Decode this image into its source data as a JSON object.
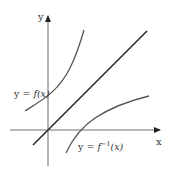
{
  "diagram": {
    "axes": {
      "x_label": "x",
      "y_label": "y",
      "axis_color": "#9a9a9a"
    },
    "curves": {
      "f": {
        "label": "y = f(x)",
        "label_prefix": "y = ",
        "label_body": "f(x)",
        "color": "#555555"
      },
      "f_inverse": {
        "label": "y = f⁻¹(x)",
        "label_prefix": "y = ",
        "label_f": "f",
        "label_sup": "−1",
        "label_arg": "(x)",
        "color": "#555555"
      },
      "identity": {
        "label": "y = x",
        "color": "#222222"
      }
    }
  }
}
